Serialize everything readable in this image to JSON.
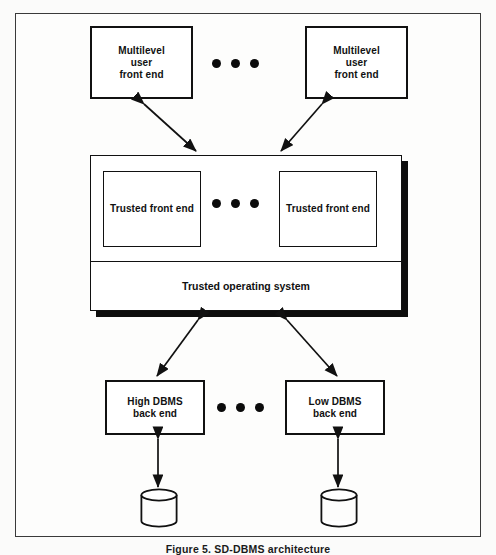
{
  "figure": {
    "caption": "Figure 5. SD-DBMS architecture",
    "frame_color": "#3a3a3a",
    "line_color": "#111111",
    "shadow_color": "#0d0d0d",
    "background": "#ffffff"
  },
  "nodes": {
    "multilevel_user_front_end_left": {
      "label": "Multilevel\nuser\nfront end"
    },
    "multilevel_user_front_end_right": {
      "label": "Multilevel\nuser\nfront end"
    },
    "trusted_front_end_left": {
      "label": "Trusted front end"
    },
    "trusted_front_end_right": {
      "label": "Trusted front end"
    },
    "trusted_operating_system": {
      "label": "Trusted operating system"
    },
    "dbms_back_end_left": {
      "label": "High DBMS\nback end"
    },
    "dbms_back_end_right": {
      "label": "Low DBMS\nback end"
    },
    "database_left": {
      "label": ""
    },
    "database_right": {
      "label": ""
    }
  },
  "ellipses": {
    "top": "• • •",
    "middle": "• • •",
    "bottom": "• • •",
    "dot_count": 3
  },
  "connections": [
    {
      "from": "multilevel_user_front_end_left",
      "to": "trusted_operating_system_container",
      "style": "double-headed-arrow"
    },
    {
      "from": "multilevel_user_front_end_right",
      "to": "trusted_operating_system_container",
      "style": "double-headed-arrow"
    },
    {
      "from": "trusted_operating_system_container",
      "to": "dbms_back_end_left",
      "style": "double-headed-arrow"
    },
    {
      "from": "trusted_operating_system_container",
      "to": "dbms_back_end_right",
      "style": "double-headed-arrow"
    },
    {
      "from": "dbms_back_end_left",
      "to": "database_left",
      "style": "double-headed-arrow"
    },
    {
      "from": "dbms_back_end_right",
      "to": "database_right",
      "style": "double-headed-arrow"
    }
  ]
}
